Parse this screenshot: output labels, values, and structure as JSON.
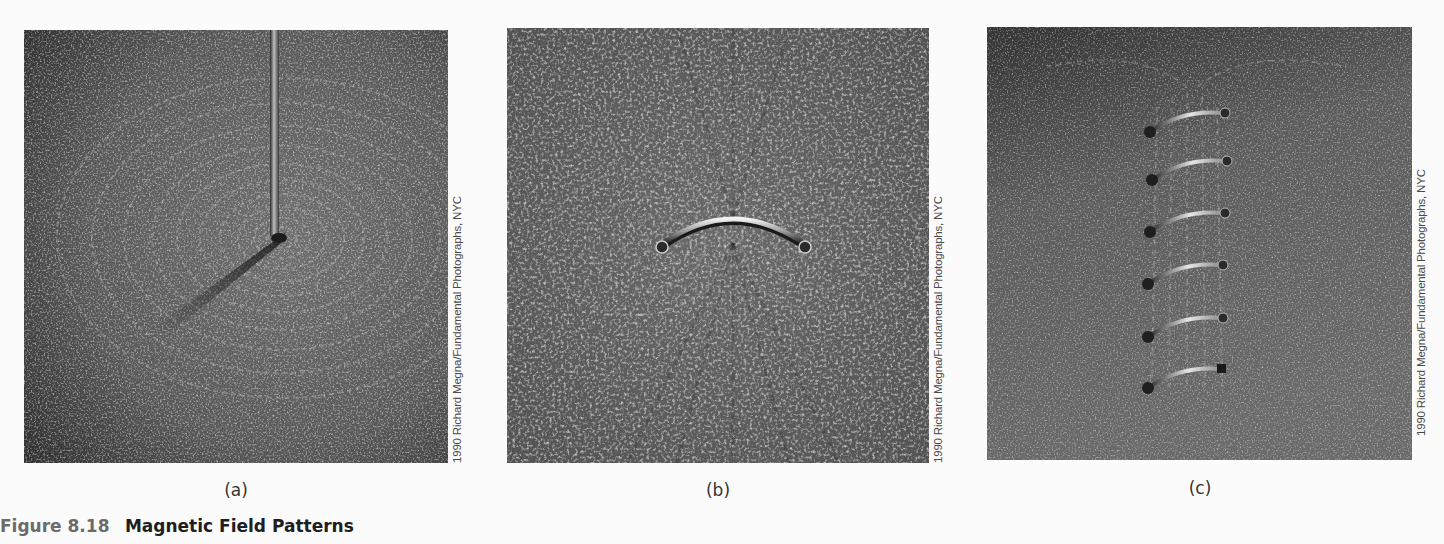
{
  "figure": {
    "number": "Figure 8.18",
    "title": "Magnetic Field Patterns",
    "panels": [
      {
        "label": "(a)",
        "subject": "straight-wire",
        "credit": "1990 Richard Megna/Fundamental Photographs, NYC"
      },
      {
        "label": "(b)",
        "subject": "current-loop",
        "credit": "1990 Richard Megna/Fundamental Photographs, NYC"
      },
      {
        "label": "(c)",
        "subject": "solenoid-coil",
        "credit": "1990 Richard Megna/Fundamental Photographs, NYC"
      }
    ]
  },
  "colors": {
    "page_background": "#fbfbfb",
    "figure_number": "#6b6b6b",
    "figure_title": "#1e1e1e",
    "credit_text": "#4a4a4a"
  }
}
